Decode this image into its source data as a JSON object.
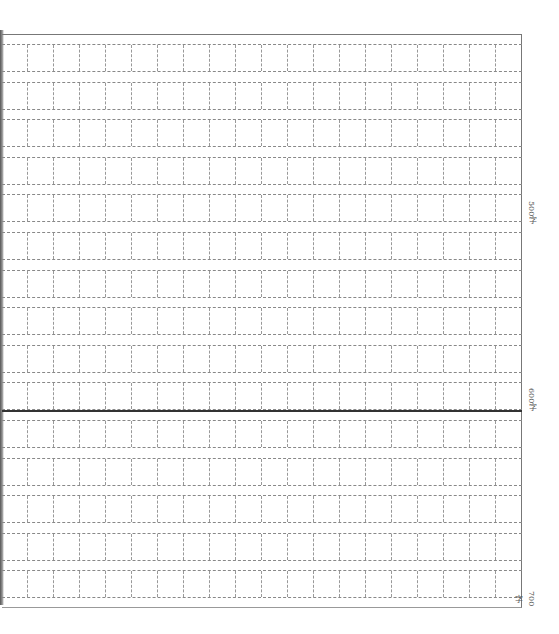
{
  "sheet": {
    "type": "composition-grid-paper",
    "columns": 20,
    "rows": 15,
    "row_top_start": 9,
    "row_pitch": 37.6,
    "cell_height": 28
  },
  "divider": {
    "after_row": 10,
    "y": 375
  },
  "markers": [
    {
      "label": "500字",
      "row": 5,
      "top": 166
    },
    {
      "label": "600字",
      "row": 10,
      "top": 353
    },
    {
      "label": "700字",
      "row": 15,
      "top": 556
    }
  ]
}
